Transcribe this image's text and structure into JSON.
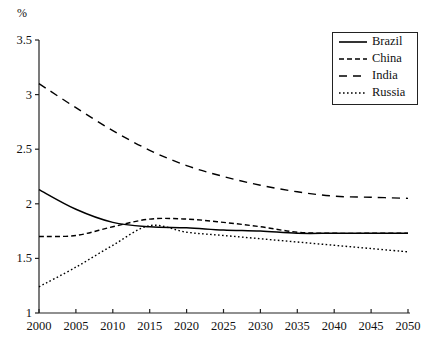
{
  "chart_data": {
    "type": "line",
    "title": "",
    "xlabel": "",
    "ylabel": "%",
    "unit_label": "%",
    "xlim": [
      2000,
      2050
    ],
    "ylim": [
      1,
      3.5
    ],
    "grid": false,
    "legend_position": "top-right",
    "x_ticks": [
      2000,
      2005,
      2010,
      2015,
      2020,
      2025,
      2030,
      2035,
      2040,
      2045,
      2050
    ],
    "x_tick_labels": [
      "2000",
      "2005",
      "2010",
      "2015",
      "2020",
      "2025",
      "2030",
      "2035",
      "2040",
      "2045",
      "2050"
    ],
    "y_ticks": [
      1,
      1.5,
      2,
      2.5,
      3,
      3.5
    ],
    "y_tick_labels": [
      "1",
      "1.5",
      "2",
      "2.5",
      "3",
      "3.5"
    ],
    "x": [
      2000,
      2005,
      2010,
      2015,
      2020,
      2025,
      2030,
      2035,
      2040,
      2045,
      2050
    ],
    "series": [
      {
        "name": "Brazil",
        "style": "solid",
        "color": "#000000",
        "values": [
          2.13,
          1.95,
          1.83,
          1.79,
          1.78,
          1.76,
          1.75,
          1.73,
          1.73,
          1.73,
          1.73
        ]
      },
      {
        "name": "China",
        "style": "dashed-short",
        "color": "#000000",
        "values": [
          1.7,
          1.71,
          1.79,
          1.86,
          1.86,
          1.83,
          1.79,
          1.74,
          1.73,
          1.73,
          1.73
        ]
      },
      {
        "name": "India",
        "style": "dashed-long",
        "color": "#000000",
        "values": [
          3.1,
          2.88,
          2.67,
          2.49,
          2.35,
          2.25,
          2.17,
          2.11,
          2.07,
          2.06,
          2.05
        ]
      },
      {
        "name": "Russia",
        "style": "dotted",
        "color": "#000000",
        "values": [
          1.24,
          1.42,
          1.62,
          1.8,
          1.74,
          1.71,
          1.68,
          1.65,
          1.62,
          1.59,
          1.56
        ]
      }
    ]
  },
  "legend": {
    "entries": [
      {
        "label": "Brazil"
      },
      {
        "label": "China"
      },
      {
        "label": "India"
      },
      {
        "label": "Russia"
      }
    ]
  }
}
